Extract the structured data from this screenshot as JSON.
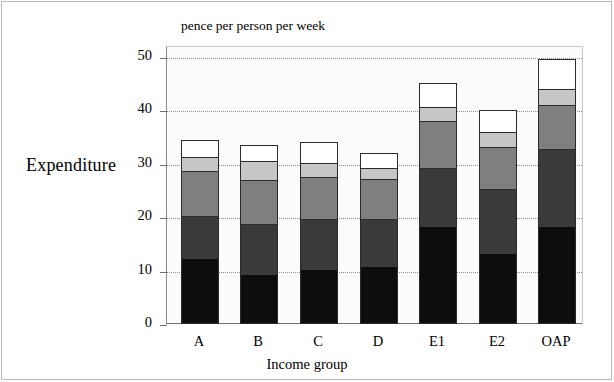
{
  "figure": {
    "y_axis_title": "Expenditure",
    "units_caption": "pence per person per week",
    "x_axis_title": "Income group"
  },
  "chart_data": {
    "type": "bar",
    "stacked": true,
    "title": "",
    "subtitle": "pence per person per week",
    "xlabel": "Income group",
    "ylabel": "Expenditure",
    "ylim": [
      0,
      52
    ],
    "yticks": [
      0,
      10,
      20,
      30,
      40,
      50
    ],
    "ytick_labels": [
      "0",
      "10",
      "20",
      "30",
      "40",
      "50"
    ],
    "grid": "horizontal-dotted",
    "legend": "none",
    "categories": [
      "A",
      "B",
      "C",
      "D",
      "E1",
      "E2",
      "OAP"
    ],
    "series": [
      {
        "name": "segment-1",
        "color": "#0d0d0d",
        "values": [
          12.0,
          9.0,
          10.0,
          10.5,
          18.0,
          13.0,
          18.0
        ]
      },
      {
        "name": "segment-2",
        "color": "#3a3a3a",
        "values": [
          8.0,
          9.5,
          9.5,
          9.0,
          11.0,
          12.0,
          14.5
        ]
      },
      {
        "name": "segment-3",
        "color": "#7f7f7f",
        "values": [
          8.5,
          8.3,
          7.8,
          7.5,
          8.8,
          8.0,
          8.3
        ]
      },
      {
        "name": "segment-4",
        "color": "#c6c6c6",
        "values": [
          2.5,
          3.5,
          2.7,
          2.0,
          2.7,
          2.7,
          3.0
        ]
      },
      {
        "name": "segment-5",
        "color": "#ffffff",
        "values": [
          3.5,
          3.2,
          4.0,
          3.0,
          4.5,
          4.3,
          5.7
        ]
      }
    ],
    "totals": [
      34.5,
      33.5,
      34.0,
      32.0,
      45.0,
      40.0,
      49.5
    ]
  }
}
